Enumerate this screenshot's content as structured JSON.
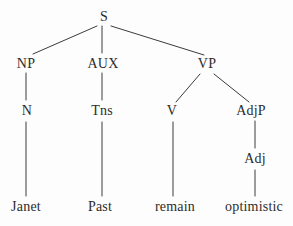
{
  "tree": {
    "diagram_type": "syntax-tree",
    "nodes": {
      "s": "S",
      "np": "NP",
      "aux": "AUX",
      "vp": "VP",
      "n": "N",
      "tns": "Tns",
      "v": "V",
      "adjp": "AdjP",
      "adj": "Adj",
      "janet": "Janet",
      "past": "Past",
      "remain": "remain",
      "optimistic": "optimistic"
    },
    "edges": [
      {
        "from": "S",
        "to": "NP"
      },
      {
        "from": "S",
        "to": "AUX"
      },
      {
        "from": "S",
        "to": "VP"
      },
      {
        "from": "NP",
        "to": "N"
      },
      {
        "from": "AUX",
        "to": "Tns"
      },
      {
        "from": "VP",
        "to": "V"
      },
      {
        "from": "VP",
        "to": "AdjP"
      },
      {
        "from": "N",
        "to": "Janet"
      },
      {
        "from": "Tns",
        "to": "Past"
      },
      {
        "from": "V",
        "to": "remain"
      },
      {
        "from": "AdjP",
        "to": "Adj"
      },
      {
        "from": "Adj",
        "to": "optimistic"
      }
    ],
    "colors": {
      "text": "#2e2c29",
      "line": "#3d3b38",
      "background": "#fdfdfd"
    }
  }
}
